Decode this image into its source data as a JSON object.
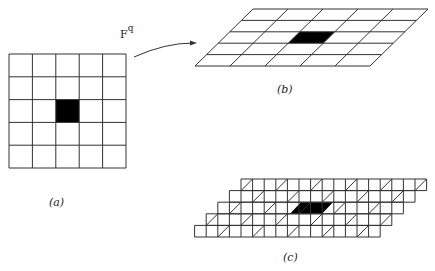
{
  "figure": {
    "panel_a": {
      "label": "(a)",
      "rows": 5,
      "cols": 5,
      "filled_cell": {
        "row": 2,
        "col": 2
      }
    },
    "panel_b": {
      "label": "(b)",
      "rows": 5,
      "cols": 5,
      "filled_cell": {
        "row": 2,
        "col": 2
      }
    },
    "panel_c": {
      "label": "(c)",
      "rows": 5,
      "cells_per_row": 16,
      "diagonal_spacing_cells": 3
    },
    "map": {
      "base": "F",
      "superscript": "q"
    },
    "colors": {
      "line": "#333333",
      "fill": "#000000",
      "background": "#ffffff"
    }
  }
}
